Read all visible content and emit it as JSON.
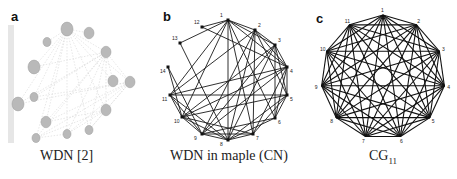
{
  "panels": [
    {
      "letter": "a",
      "caption": "WDN [2]",
      "graph": {
        "style": "faint-gray-ellipse-nodes",
        "nodes": [
          {
            "x": 67,
            "y": 29,
            "r": 6
          },
          {
            "x": 89,
            "y": 33,
            "r": 5
          },
          {
            "x": 47,
            "y": 42,
            "r": 4
          },
          {
            "x": 106,
            "y": 52,
            "r": 5
          },
          {
            "x": 34,
            "y": 67,
            "r": 6
          },
          {
            "x": 113,
            "y": 81,
            "r": 5
          },
          {
            "x": 130,
            "y": 82,
            "r": 5
          },
          {
            "x": 34,
            "y": 97,
            "r": 4
          },
          {
            "x": 18,
            "y": 104,
            "r": 6
          },
          {
            "x": 106,
            "y": 110,
            "r": 5
          },
          {
            "x": 46,
            "y": 122,
            "r": 5
          },
          {
            "x": 89,
            "y": 130,
            "r": 4
          },
          {
            "x": 67,
            "y": 134,
            "r": 4
          },
          {
            "x": 36,
            "y": 138,
            "r": 4
          }
        ]
      }
    },
    {
      "letter": "b",
      "caption": "WDN in maple (CN)",
      "graph": {
        "node_labels": [
          "1",
          "2",
          "3",
          "4",
          "5",
          "6",
          "7",
          "8",
          "9",
          "10",
          "11",
          "12",
          "13",
          "14"
        ],
        "nodes": [
          {
            "id": "1",
            "x": 228,
            "y": 20
          },
          {
            "id": "2",
            "x": 255,
            "y": 30
          },
          {
            "id": "3",
            "x": 275,
            "y": 45
          },
          {
            "id": "4",
            "x": 287,
            "y": 67
          },
          {
            "id": "5",
            "x": 287,
            "y": 95
          },
          {
            "id": "6",
            "x": 275,
            "y": 118
          },
          {
            "id": "7",
            "x": 253,
            "y": 134
          },
          {
            "id": "8",
            "x": 228,
            "y": 140
          },
          {
            "id": "9",
            "x": 202,
            "y": 134
          },
          {
            "id": "10",
            "x": 182,
            "y": 117
          },
          {
            "id": "11",
            "x": 170,
            "y": 95
          },
          {
            "id": "12",
            "x": 202,
            "y": 27
          },
          {
            "id": "13",
            "x": 180,
            "y": 43
          },
          {
            "id": "14",
            "x": 168,
            "y": 67
          }
        ]
      }
    },
    {
      "letter": "c",
      "caption_main": "CG",
      "caption_sub": "11",
      "graph": {
        "type": "complete-graph",
        "n": 11,
        "node_labels": [
          "1",
          "2",
          "3",
          "4",
          "5",
          "6",
          "7",
          "8",
          "9",
          "10",
          "11"
        ],
        "center": {
          "x": 383,
          "y": 77
        },
        "radius": 62
      }
    }
  ]
}
